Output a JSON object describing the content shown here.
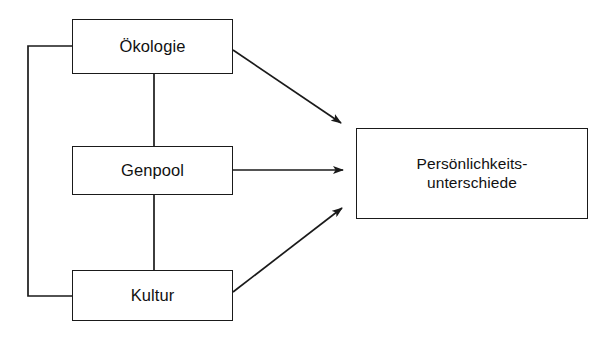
{
  "diagram": {
    "type": "flow-diagram",
    "language": "de",
    "background_color": "#ffffff",
    "stroke_color": "#1a1a1a",
    "text_color": "#111111",
    "nodes": [
      {
        "id": "oekologie",
        "label": "Ökologie",
        "role": "source",
        "box": {
          "x": 72,
          "y": 19,
          "w": 161,
          "h": 55
        }
      },
      {
        "id": "genpool",
        "label": "Genpool",
        "role": "source",
        "box": {
          "x": 72,
          "y": 146,
          "w": 161,
          "h": 49
        }
      },
      {
        "id": "kultur",
        "label": "Kultur",
        "role": "source",
        "box": {
          "x": 72,
          "y": 270,
          "w": 161,
          "h": 51
        }
      },
      {
        "id": "persoenlichkeitsunterschiede",
        "label": "Persönlichkeits-\nunterschiede",
        "label_line_1": "Persönlichkeits-",
        "label_line_2": "unterschiede",
        "role": "target",
        "box": {
          "x": 356,
          "y": 128,
          "w": 232,
          "h": 91
        }
      }
    ],
    "edges": [
      {
        "id": "edge-oekologie-to-persoenlichkeit",
        "from": "oekologie",
        "to": "persoenlichkeitsunterschiede",
        "style": "arrow",
        "arrowhead": "filled-triangle",
        "path": "M233,50 L345,126"
      },
      {
        "id": "edge-genpool-to-persoenlichkeit",
        "from": "genpool",
        "to": "persoenlichkeitsunterschiede",
        "style": "arrow",
        "arrowhead": "filled-triangle",
        "path": "M233,170 L349,170"
      },
      {
        "id": "edge-kultur-to-persoenlichkeit",
        "from": "kultur",
        "to": "persoenlichkeitsunterschiede",
        "style": "arrow",
        "arrowhead": "filled-triangle",
        "path": "M233,292 L347,204"
      },
      {
        "id": "edge-oekologie-genpool-vertical",
        "from": "oekologie",
        "to": "genpool",
        "style": "plain-line",
        "arrowhead": "none",
        "path": "M154,74 L154,146"
      },
      {
        "id": "edge-genpool-kultur-vertical",
        "from": "genpool",
        "to": "kultur",
        "style": "plain-line",
        "arrowhead": "none",
        "path": "M154,195 L154,270"
      },
      {
        "id": "edge-bracket-oekologie-kultur",
        "from": "oekologie",
        "to": "kultur",
        "style": "bracket-line",
        "arrowhead": "none",
        "path": "M72,46 L28,46 L28,296 L72,296"
      }
    ]
  }
}
